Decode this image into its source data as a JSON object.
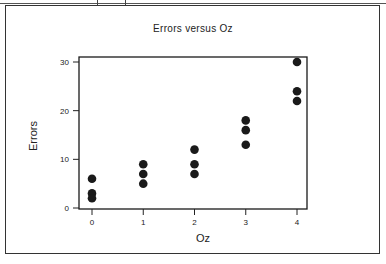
{
  "chart_data": {
    "type": "scatter",
    "title": "Errors versus Oz",
    "xlabel": "Oz",
    "ylabel": "Errors",
    "xlim": [
      -0.25,
      4.25
    ],
    "ylim": [
      0,
      31
    ],
    "xticks": [
      0,
      1,
      2,
      3,
      4
    ],
    "yticks": [
      0,
      10,
      20,
      30
    ],
    "grid": false,
    "legend": null,
    "series": [
      {
        "name": "Errors",
        "x": [
          0,
          0,
          0,
          1,
          1,
          1,
          2,
          2,
          2,
          3,
          3,
          3,
          4,
          4,
          4
        ],
        "y": [
          6,
          3,
          2,
          9,
          7,
          5,
          12,
          9,
          7,
          18,
          16,
          13,
          30,
          24,
          22
        ],
        "marker": "filled-circle",
        "color": "#1a1a1a"
      }
    ]
  },
  "colors": {
    "ink": "#1a1a1a",
    "frame": "#333333",
    "background": "#ffffff"
  }
}
